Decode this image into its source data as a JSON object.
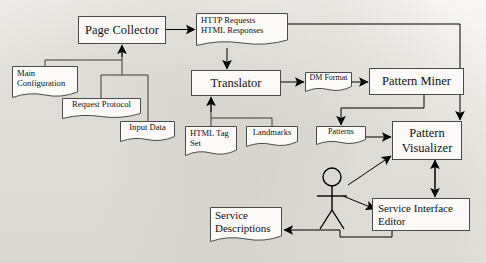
{
  "diagram": {
    "type": "flowchart",
    "actor": {
      "name": "user-actor",
      "label": ""
    },
    "nodes": [
      {
        "id": "page-collector",
        "label": "Page Collector",
        "shape": "process",
        "x": 78,
        "y": 16,
        "w": 88,
        "h": 28
      },
      {
        "id": "http-html",
        "line1": "HTTP Requests",
        "line2": "HTML Responses",
        "shape": "document",
        "x": 196,
        "y": 13,
        "w": 92,
        "h": 35
      },
      {
        "id": "main-configuration",
        "line1": "Main",
        "line2": "Configuration",
        "shape": "document",
        "x": 12,
        "y": 66,
        "w": 66,
        "h": 34
      },
      {
        "id": "request-protocol",
        "label": "Request Protocol",
        "shape": "document",
        "x": 62,
        "y": 98,
        "w": 79,
        "h": 22
      },
      {
        "id": "input-data",
        "label": "Input Data",
        "shape": "document",
        "x": 120,
        "y": 121,
        "w": 55,
        "h": 22
      },
      {
        "id": "translator",
        "label": "Translator",
        "shape": "process",
        "x": 191,
        "y": 70,
        "w": 90,
        "h": 26
      },
      {
        "id": "dm-format",
        "label": "DM Format",
        "shape": "document",
        "x": 305,
        "y": 72,
        "w": 47,
        "h": 21
      },
      {
        "id": "pattern-miner",
        "label": "Pattern Miner",
        "shape": "process",
        "x": 369,
        "y": 68,
        "w": 95,
        "h": 27
      },
      {
        "id": "html-tag-set",
        "line1": "HTML Tag",
        "line2": "Set",
        "shape": "document",
        "x": 185,
        "y": 126,
        "w": 52,
        "h": 32
      },
      {
        "id": "landmarks",
        "label": "Landmarks",
        "shape": "document",
        "x": 246,
        "y": 126,
        "w": 52,
        "h": 22
      },
      {
        "id": "patterns",
        "label": "Patterns",
        "shape": "document",
        "x": 316,
        "y": 126,
        "w": 50,
        "h": 20
      },
      {
        "id": "pattern-visualizer",
        "line1": "Pattern",
        "line2": "Visualizer",
        "shape": "process",
        "x": 392,
        "y": 121,
        "w": 70,
        "h": 39
      },
      {
        "id": "service-interface-editor",
        "line1": "Service Interface",
        "line2": "Editor",
        "shape": "process",
        "x": 372,
        "y": 198,
        "w": 98,
        "h": 33
      },
      {
        "id": "service-descriptions",
        "line1": "Service",
        "line2": "Descriptions",
        "shape": "document",
        "x": 210,
        "y": 207,
        "w": 72,
        "h": 38
      }
    ],
    "edges": [
      {
        "id": "page-collector-to-http-html",
        "from": "page-collector",
        "to": "http-html"
      },
      {
        "id": "http-html-to-translator",
        "from": "http-html",
        "to": "translator"
      },
      {
        "id": "http-html-to-pattern-visualizer",
        "from": "http-html",
        "to": "pattern-visualizer"
      },
      {
        "id": "inputs-to-page-collector",
        "from": "main-configuration",
        "to": "page-collector"
      },
      {
        "id": "request-protocol-to-page-collector",
        "from": "request-protocol",
        "to": "page-collector"
      },
      {
        "id": "input-data-to-page-collector",
        "from": "input-data",
        "to": "page-collector"
      },
      {
        "id": "html-tag-set-to-translator",
        "from": "html-tag-set",
        "to": "translator"
      },
      {
        "id": "landmarks-to-translator",
        "from": "landmarks",
        "to": "translator"
      },
      {
        "id": "translator-to-dm-format",
        "from": "translator",
        "to": "dm-format"
      },
      {
        "id": "dm-format-to-pattern-miner",
        "from": "dm-format",
        "to": "pattern-miner"
      },
      {
        "id": "pattern-miner-to-patterns",
        "from": "pattern-miner",
        "to": "patterns"
      },
      {
        "id": "patterns-to-pattern-visualizer",
        "from": "patterns",
        "to": "pattern-visualizer"
      },
      {
        "id": "actor-to-pattern-visualizer",
        "from": "user-actor",
        "to": "pattern-visualizer"
      },
      {
        "id": "actor-to-service-interface-editor",
        "from": "user-actor",
        "to": "service-interface-editor"
      },
      {
        "id": "pattern-visualizer-editor-bidirectional",
        "from": "pattern-visualizer",
        "to": "service-interface-editor"
      },
      {
        "id": "editor-to-service-descriptions",
        "from": "service-interface-editor",
        "to": "service-descriptions"
      }
    ],
    "colors": {
      "stroke": "#3a3a3a",
      "arrow": "#000000",
      "box_fill": "#fbfaf8",
      "page": "#f2f1ed"
    }
  }
}
